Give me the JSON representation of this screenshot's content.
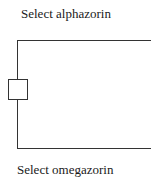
{
  "diagram": {
    "top_option": {
      "label": "Select alphazorin"
    },
    "bottom_option": {
      "label": "Select omegazorin"
    },
    "switch": {
      "name": "selector-box"
    }
  }
}
